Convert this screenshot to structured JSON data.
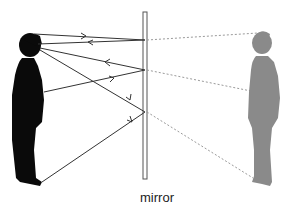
{
  "diagram": {
    "mirror_label": "mirror",
    "colors": {
      "person": "#0a0a0a",
      "image": "#8a8a8a",
      "ray": "#333333",
      "virtual_ray": "#9a9a9a",
      "mirror": "#555555"
    },
    "rays": [
      {
        "name": "top-of-head-ray",
        "description": "from top of head to mirror and back to eye"
      },
      {
        "name": "eye-ray",
        "description": "reflected ray returning to eye"
      },
      {
        "name": "chest-ray",
        "description": "from chest to mirror and back to eye"
      },
      {
        "name": "feet-ray",
        "description": "from feet to mirror and back to eye"
      }
    ]
  }
}
